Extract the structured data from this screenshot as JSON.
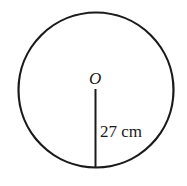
{
  "diagram": {
    "type": "circle-radius",
    "center_label": "O",
    "radius_label": "27 cm",
    "radius_value": 27,
    "radius_unit": "cm",
    "stroke_color": "#1a1a1a",
    "background": "#ffffff"
  }
}
